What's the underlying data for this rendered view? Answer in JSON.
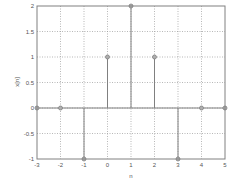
{
  "chart_data": {
    "type": "stem",
    "title": "",
    "xlabel": "n",
    "ylabel": "x[n]",
    "xlim": [
      -3,
      5
    ],
    "ylim": [
      -1,
      2
    ],
    "grid": true,
    "x": [
      -3,
      -2,
      -1,
      0,
      1,
      2,
      3,
      4,
      5
    ],
    "values": [
      0,
      0,
      -1,
      1,
      2,
      1,
      -1,
      0,
      0
    ],
    "xticks": [
      "-3",
      "-2",
      "-1",
      "0",
      "1",
      "2",
      "3",
      "4",
      "5"
    ],
    "yticks": [
      "-1",
      "-0.5",
      "0",
      "0.5",
      "1",
      "1.5",
      "2"
    ],
    "colors": {
      "stem": "#808080",
      "marker": "#808080",
      "grid": "#9a9a9a",
      "axes": "#808080"
    }
  }
}
